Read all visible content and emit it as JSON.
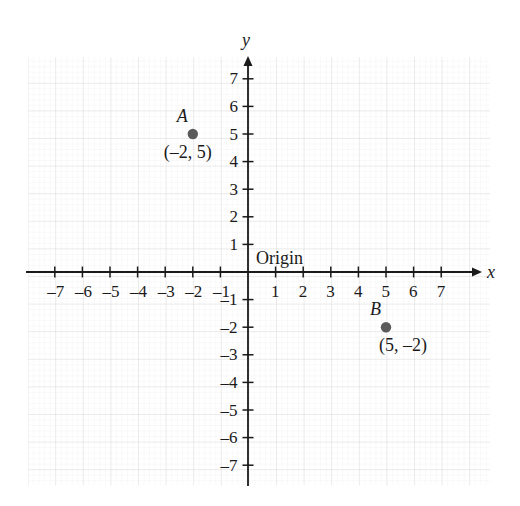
{
  "figure": {
    "type": "coordinate-plane",
    "axis_labels": {
      "x": "x",
      "y": "y"
    },
    "origin_label": "Origin",
    "x_ticks": [
      {
        "value": -7,
        "label": "–7"
      },
      {
        "value": -6,
        "label": "–6"
      },
      {
        "value": -5,
        "label": "–5"
      },
      {
        "value": -4,
        "label": "–4"
      },
      {
        "value": -3,
        "label": "–3"
      },
      {
        "value": -2,
        "label": "–2"
      },
      {
        "value": -1,
        "label": "–1"
      },
      {
        "value": 1,
        "label": "1"
      },
      {
        "value": 2,
        "label": "2"
      },
      {
        "value": 3,
        "label": "3"
      },
      {
        "value": 4,
        "label": "4"
      },
      {
        "value": 5,
        "label": "5"
      },
      {
        "value": 6,
        "label": "6"
      },
      {
        "value": 7,
        "label": "7"
      }
    ],
    "y_ticks": [
      {
        "value": 7,
        "label": "7"
      },
      {
        "value": 6,
        "label": "6"
      },
      {
        "value": 5,
        "label": "5"
      },
      {
        "value": 4,
        "label": "4"
      },
      {
        "value": 3,
        "label": "3"
      },
      {
        "value": 2,
        "label": "2"
      },
      {
        "value": 1,
        "label": "1"
      },
      {
        "value": -1,
        "label": "–1"
      },
      {
        "value": -2,
        "label": "–2"
      },
      {
        "value": -3,
        "label": "–3"
      },
      {
        "value": -4,
        "label": "–4"
      },
      {
        "value": -5,
        "label": "–5"
      },
      {
        "value": -6,
        "label": "–6"
      },
      {
        "value": -7,
        "label": "–7"
      }
    ],
    "points": [
      {
        "name": "A",
        "x": -2,
        "y": 5,
        "coord_label": "(–2, 5)"
      },
      {
        "name": "B",
        "x": 5,
        "y": -2,
        "coord_label": "(5, –2)"
      }
    ]
  },
  "chart_data": {
    "type": "scatter",
    "title": "",
    "xlabel": "x",
    "ylabel": "y",
    "xlim": [
      -8,
      8
    ],
    "ylim": [
      -8,
      8
    ],
    "grid": true,
    "legend": "none",
    "annotations": [
      "Origin"
    ],
    "series": [
      {
        "name": "points",
        "points": [
          {
            "label": "A",
            "x": -2,
            "y": 5
          },
          {
            "label": "B",
            "x": 5,
            "y": -2
          }
        ]
      }
    ],
    "colors": {
      "point": "#5a5a5a",
      "axis": "#1a1a1a",
      "grid_minor": "#ededed",
      "grid_major": "#dcdcdc",
      "text": "#1a1a1a"
    }
  }
}
